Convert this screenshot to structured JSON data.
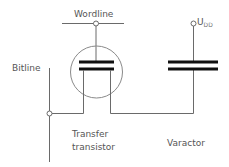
{
  "diagram": {
    "type": "circuit-schematic",
    "labels": {
      "wordline": "Wordline",
      "bitline": "Bitline",
      "supply_main": "U",
      "supply_sub": "DD",
      "transistor_line1": "Transfer",
      "transistor_line2": "transistor",
      "varactor": "Varactor"
    },
    "components": [
      {
        "id": "transfer-transistor",
        "kind": "MOS transistor (circled)"
      },
      {
        "id": "varactor",
        "kind": "capacitor"
      }
    ],
    "nets": [
      {
        "name": "Wordline",
        "connects": [
          "transfer-transistor.gate"
        ]
      },
      {
        "name": "Bitline",
        "connects": [
          "transfer-transistor.source"
        ]
      },
      {
        "name": "U_DD",
        "connects": [
          "varactor.top"
        ]
      },
      {
        "name": "storage-node",
        "connects": [
          "transfer-transistor.drain",
          "varactor.bottom"
        ]
      }
    ],
    "colors": {
      "wire": "#6a6a6a",
      "plate": "#111111",
      "text": "#555555",
      "background": "#ffffff"
    }
  }
}
